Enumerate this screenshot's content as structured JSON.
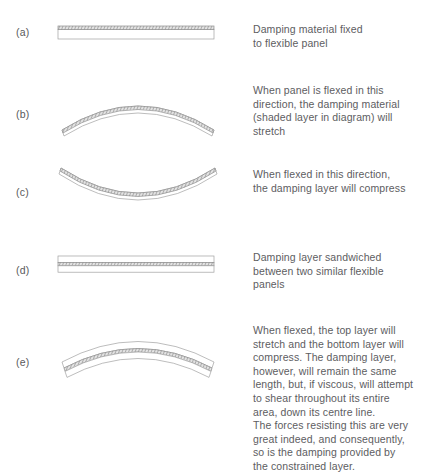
{
  "figure": {
    "type": "technical-illustration",
    "background_color": "#ffffff",
    "line_color": "#9a9a9a",
    "shaded_layer_color": "#8d8d8d",
    "text_color": "#5d5d5f",
    "panel_fill": "#ffffff",
    "rows": [
      {
        "label": "(a)",
        "diagram_name": "flat-panel-with-damping-layer-on-top",
        "caption": "Damping material fixed\nto flexible panel"
      },
      {
        "label": "(b)",
        "diagram_name": "panel-flexed-convex-up-damping-layer-stretching",
        "caption": "When panel is flexed in this\ndirection, the damping material\n(shaded layer in diagram) will\nstretch"
      },
      {
        "label": "(c)",
        "diagram_name": "panel-flexed-concave-up-damping-layer-compressing",
        "caption": "When flexed in this direction,\nthe damping layer will compress"
      },
      {
        "label": "(d)",
        "diagram_name": "flat-sandwich-panel-with-damping-layer-in-middle",
        "caption": "Damping layer sandwiched\nbetween two similar flexible\npanels"
      },
      {
        "label": "(e)",
        "diagram_name": "flexed-sandwich-panel-constrained-damping-layer-shearing",
        "caption": "When flexed, the top layer will\nstretch and the bottom layer will\ncompress. The damping layer,\nhowever, will remain the same\nlength, but, if viscous, will attempt\nto shear throughout its entire\narea, down its centre line.\nThe forces resisting this are very\ngreat indeed, and consequently,\nso is the damping provided by\nthe constrained layer."
      }
    ]
  }
}
